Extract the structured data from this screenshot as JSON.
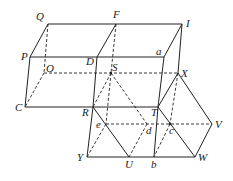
{
  "diagram": {
    "type": "geometry",
    "labels": {
      "Q": "Q",
      "F": "F",
      "I": "I",
      "P": "P",
      "D": "D",
      "a": "a",
      "O": "O",
      "S": "S",
      "X": "X",
      "C": "C",
      "R": "R",
      "T": "T",
      "e": "e",
      "d": "d",
      "c": "c",
      "V": "V",
      "Y": "Y",
      "U": "U",
      "b": "b",
      "W": "W"
    },
    "points": {
      "Q": [
        48,
        24
      ],
      "F": [
        116,
        24
      ],
      "I": [
        182,
        24
      ],
      "P": [
        30,
        57
      ],
      "D": [
        97,
        57
      ],
      "a": [
        164,
        57
      ],
      "O": [
        44,
        73
      ],
      "S": [
        111,
        73
      ],
      "X": [
        178,
        73
      ],
      "C": [
        25,
        107
      ],
      "R": [
        93,
        107
      ],
      "T": [
        158,
        107
      ],
      "e": [
        106,
        124
      ],
      "d": [
        147,
        124
      ],
      "c": [
        170,
        124
      ],
      "V": [
        212,
        124
      ],
      "Y": [
        87,
        157
      ],
      "U": [
        129,
        157
      ],
      "b": [
        154,
        157
      ],
      "W": [
        195,
        157
      ]
    }
  }
}
